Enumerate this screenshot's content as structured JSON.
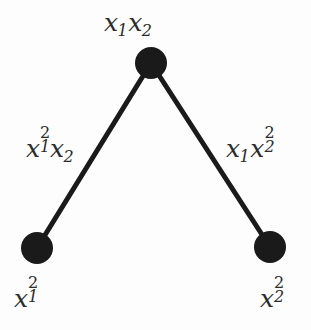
{
  "figure": {
    "type": "graph-diagram",
    "width": 311,
    "height": 330,
    "background_color": "#fdfdfd",
    "node_color": "#1a1a1a",
    "edge_color": "#1a1a1a",
    "text_color": "#2b2b2b",
    "edge_width": 5,
    "node_radius": 16
  },
  "nodes": [
    {
      "id": "top",
      "label_plain": "x1x2",
      "label_parts": [
        {
          "base": "x",
          "sub": "1"
        },
        {
          "base": "x",
          "sub": "2"
        }
      ],
      "cx": 151,
      "cy": 63,
      "r": 16,
      "label_position": "above"
    },
    {
      "id": "bottom-left",
      "label_plain": "x1^2",
      "label_parts": [
        {
          "base": "x",
          "sub": "1",
          "sup": "2"
        }
      ],
      "cx": 37,
      "cy": 248,
      "r": 16,
      "label_position": "below"
    },
    {
      "id": "bottom-right",
      "label_plain": "x2^2",
      "label_parts": [
        {
          "base": "x",
          "sub": "2",
          "sup": "2"
        }
      ],
      "cx": 270,
      "cy": 247,
      "r": 16,
      "label_position": "below"
    }
  ],
  "edges": [
    {
      "id": "edge-left",
      "from": "bottom-left",
      "to": "top",
      "label_plain": "x1^2x2",
      "label_parts": [
        {
          "base": "x",
          "sub": "1",
          "sup": "2"
        },
        {
          "base": "x",
          "sub": "2"
        }
      ],
      "x1": 37,
      "y1": 248,
      "x2": 151,
      "y2": 63
    },
    {
      "id": "edge-right",
      "from": "top",
      "to": "bottom-right",
      "label_plain": "x1x2^2",
      "label_parts": [
        {
          "base": "x",
          "sub": "1"
        },
        {
          "base": "x",
          "sub": "2",
          "sup": "2"
        }
      ],
      "x1": 151,
      "y1": 63,
      "x2": 270,
      "y2": 247
    }
  ],
  "labels": {
    "top_node": "x1x2",
    "edge_left": "x1^2x2",
    "edge_right": "x1x2^2",
    "bottom_left_node": "x1^2",
    "bottom_right_node": "x2^2"
  }
}
